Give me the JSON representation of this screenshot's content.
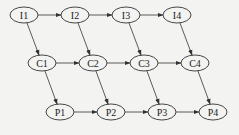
{
  "diagram": {
    "nodes": [
      {
        "id": "I1",
        "label": "I1",
        "cx": 24,
        "cy": 15
      },
      {
        "id": "I2",
        "label": "I2",
        "cx": 75,
        "cy": 15
      },
      {
        "id": "I3",
        "label": "I3",
        "cx": 126,
        "cy": 15
      },
      {
        "id": "I4",
        "label": "I4",
        "cx": 177,
        "cy": 15
      },
      {
        "id": "C1",
        "label": "C1",
        "cx": 42,
        "cy": 63
      },
      {
        "id": "C2",
        "label": "C2",
        "cx": 93,
        "cy": 63
      },
      {
        "id": "C3",
        "label": "C3",
        "cx": 144,
        "cy": 63
      },
      {
        "id": "C4",
        "label": "C4",
        "cx": 195,
        "cy": 63
      },
      {
        "id": "P1",
        "label": "P1",
        "cx": 60,
        "cy": 112
      },
      {
        "id": "P2",
        "label": "P2",
        "cx": 111,
        "cy": 112
      },
      {
        "id": "P3",
        "label": "P3",
        "cx": 162,
        "cy": 112
      },
      {
        "id": "P4",
        "label": "P4",
        "cx": 213,
        "cy": 112
      }
    ],
    "edges": [
      [
        "I1",
        "I2"
      ],
      [
        "I2",
        "I3"
      ],
      [
        "I3",
        "I4"
      ],
      [
        "C1",
        "C2"
      ],
      [
        "C2",
        "C3"
      ],
      [
        "C3",
        "C4"
      ],
      [
        "P1",
        "P2"
      ],
      [
        "P2",
        "P3"
      ],
      [
        "P3",
        "P4"
      ],
      [
        "I1",
        "C1"
      ],
      [
        "I2",
        "C2"
      ],
      [
        "I3",
        "C3"
      ],
      [
        "I4",
        "C4"
      ],
      [
        "C1",
        "P1"
      ],
      [
        "C2",
        "P2"
      ],
      [
        "C3",
        "P3"
      ],
      [
        "C4",
        "P4"
      ]
    ],
    "style": {
      "stroke": "#333333",
      "background": "#f3f3f1"
    }
  }
}
